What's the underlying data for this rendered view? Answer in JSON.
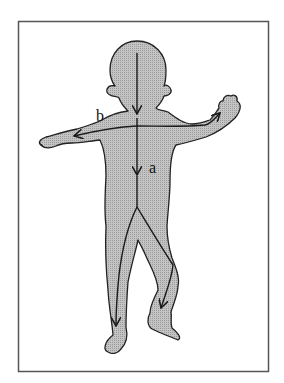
{
  "figure": {
    "labels": {
      "a": "a",
      "b": "b"
    },
    "colors": {
      "background": "#ffffff",
      "frame": "#555555",
      "body_fill": "#b8b8b8",
      "outline": "#222222"
    },
    "arrows": [
      {
        "id": "a",
        "description": "Vertical arrow from head down the trunk, splitting into both legs"
      },
      {
        "id": "b",
        "description": "Horizontal arrow across shoulders pointing toward both hands"
      }
    ]
  }
}
